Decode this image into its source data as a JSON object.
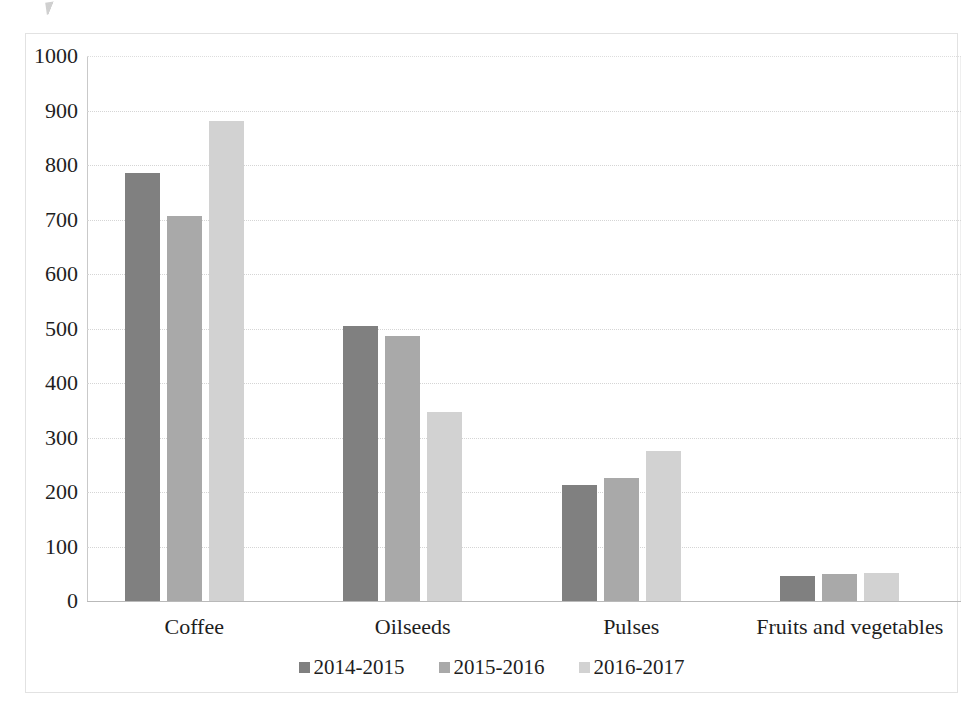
{
  "chart_data": {
    "type": "bar",
    "title": "",
    "subtitle": "",
    "xlabel": "",
    "ylabel": "",
    "categories": [
      "Coffee",
      "Oilseeds",
      "Pulses",
      "Fruits and vegetables"
    ],
    "series": [
      {
        "name": "2014-2015",
        "color": "#808080",
        "values": [
          785,
          505,
          212,
          46
        ]
      },
      {
        "name": "2015-2016",
        "color": "#a9a9a9",
        "values": [
          707,
          487,
          225,
          49
        ]
      },
      {
        "name": "2016-2017",
        "color": "#d2d2d2",
        "values": [
          880,
          347,
          276,
          52
        ]
      }
    ],
    "ylim": [
      0,
      1000
    ],
    "ytick_labels": [
      "1000",
      "900",
      "800",
      "700",
      "600",
      "500",
      "400",
      "300",
      "200",
      "100",
      "0"
    ],
    "ytick_values": [
      1000,
      900,
      800,
      700,
      600,
      500,
      400,
      300,
      200,
      100,
      0
    ],
    "grid": true,
    "grid_axis": "y",
    "legend_position": "bottom",
    "annotations": []
  }
}
